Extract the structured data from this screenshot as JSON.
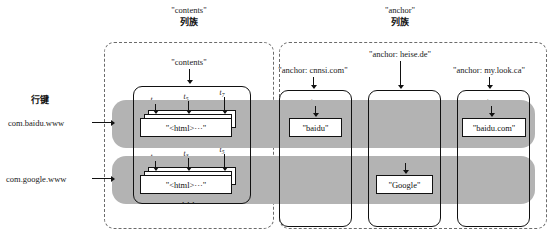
{
  "diagram": {
    "title_contents_family": "\"contents\"",
    "title_contents_family_cjk": "列族",
    "title_anchor_family": "\"anchor\"",
    "title_anchor_family_cjk": "列族",
    "row_key_label": "行键",
    "ellipsis": "···"
  },
  "rows": [
    {
      "key": "com.baidu.www"
    },
    {
      "key": "com.google.www"
    }
  ],
  "columns": {
    "contents": {
      "label": "\"contents\""
    },
    "anchor_cnnsi": {
      "label": "\"anchor: cnnsi.com\""
    },
    "anchor_heise": {
      "label": "\"anchor: heise.de\""
    },
    "anchor_mylook": {
      "label": "\"anchor: my.look.ca\""
    }
  },
  "cells": {
    "contents_row1": {
      "value": "\"<html>···\"",
      "timestamps": [
        "t",
        "t",
        "t"
      ],
      "timestamp_subs": [
        "3",
        "5",
        "7"
      ]
    },
    "contents_row2": {
      "value": "\"<html>···\"",
      "timestamps": [
        "t",
        "t",
        "t"
      ],
      "timestamp_subs": [
        "1",
        "3",
        "5"
      ]
    },
    "anchor_cnnsi_row1": {
      "value": "\"baidu\"",
      "timestamp": "t",
      "timestamp_sub": "8"
    },
    "anchor_mylook_row1": {
      "value": "\"baidu.com\"",
      "timestamp": "t",
      "timestamp_sub": "9"
    },
    "anchor_heise_row2": {
      "value": "\"Google\"",
      "timestamp": "t",
      "timestamp_sub": "4"
    }
  },
  "colors": {
    "row_band": "#b3b3b3",
    "stroke": "#111111",
    "dashed": "#6b6b6b",
    "cell_bg": "#ffffff"
  }
}
